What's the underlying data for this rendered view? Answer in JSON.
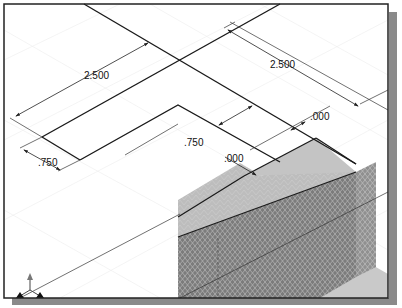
{
  "figure": {
    "dimensions": [
      {
        "id": "dim-top-left-length",
        "text": "2.500"
      },
      {
        "id": "dim-top-right-length",
        "text": "2.500"
      },
      {
        "id": "dim-left-width",
        "text": ".750"
      },
      {
        "id": "dim-center-width",
        "text": ".750"
      },
      {
        "id": "dim-right-offset",
        "text": ".000"
      },
      {
        "id": "dim-center-offset",
        "text": ".000"
      }
    ],
    "triad": {
      "icon": "coordinate-triad-icon"
    },
    "colors": {
      "frame": "#222222",
      "shadow": "#8a8a8a",
      "sketch_line": "#1a1a1a",
      "dim_line": "#333333",
      "grid": "#e4e4e4",
      "block_top": "#bdbdbd",
      "block_front": "#7a7a7a",
      "block_side": "#8e8e8e",
      "floor": "#c8c8c8"
    }
  }
}
